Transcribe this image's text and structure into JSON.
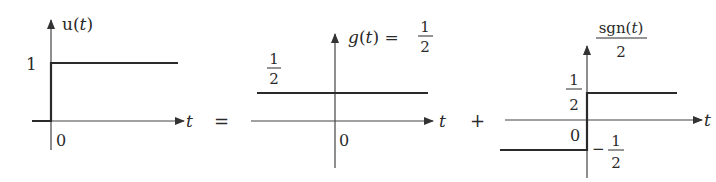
{
  "equation": {
    "equals": "=",
    "plus": "+"
  },
  "panels": [
    {
      "id": "unit-step",
      "ylabel_fn": "u",
      "ylabel_arg": "t",
      "level_label": "1",
      "origin_label": "0",
      "xlabel": "t"
    },
    {
      "id": "constant-half",
      "ylabel_fn": "g",
      "ylabel_arg": "t",
      "ylabel_eq": "=",
      "ylabel_num": "1",
      "ylabel_den": "2",
      "level_num": "1",
      "level_den": "2",
      "origin_label": "0",
      "xlabel": "t"
    },
    {
      "id": "half-signum",
      "ylabel_fn": "sgn",
      "ylabel_arg": "t",
      "ylabel_den": "2",
      "upper_num": "1",
      "upper_den": "2",
      "lower_sign": "−",
      "lower_num": "1",
      "lower_den": "2",
      "origin_label": "0",
      "xlabel": "t"
    }
  ],
  "colors": {
    "axis": "#444444",
    "signal": "#2a2a2a"
  }
}
